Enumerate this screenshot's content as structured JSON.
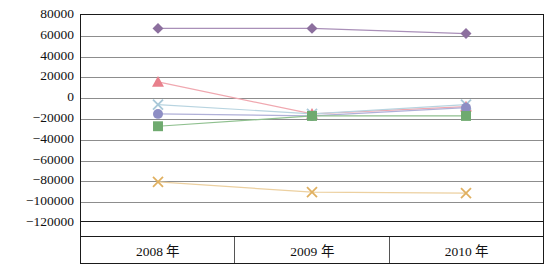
{
  "chart_data": {
    "type": "line",
    "title": "",
    "subtitle": "",
    "xlabel": "",
    "ylabel": "",
    "categories": [
      "2008 年",
      "2009 年",
      "2010 年"
    ],
    "ylim": [
      -120000,
      80000
    ],
    "ytick_step": 20000,
    "yticks": [
      80000,
      60000,
      40000,
      20000,
      0,
      -20000,
      -40000,
      -60000,
      -80000,
      -100000,
      -120000
    ],
    "ytick_labels": [
      "80000",
      "60000",
      "40000",
      "20000",
      "0",
      "−20000",
      "−40000",
      "−60000",
      "−80000",
      "−100000",
      "−120000"
    ],
    "grid": true,
    "legend": "none",
    "series": [
      {
        "name": "series-1",
        "marker": "diamond",
        "color": "#8c6f9e",
        "line_color": "#a98fb8",
        "values": [
          67000,
          67000,
          62000
        ]
      },
      {
        "name": "series-2",
        "marker": "triangle",
        "color": "#e8808c",
        "line_color": "#f0a8b0",
        "values": [
          15000,
          -16000,
          -9000
        ]
      },
      {
        "name": "series-3",
        "marker": "cross",
        "color": "#a8c8d8",
        "line_color": "#b8d4e0",
        "values": [
          -7000,
          -16000,
          -7000
        ]
      },
      {
        "name": "series-4",
        "marker": "circle",
        "color": "#8e8ec4",
        "line_color": "#b0b0d8",
        "values": [
          -16000,
          -18000,
          -10000
        ]
      },
      {
        "name": "series-5",
        "marker": "square",
        "color": "#6faa6f",
        "line_color": "#8fc08f",
        "values": [
          -28000,
          -18000,
          -18000
        ]
      },
      {
        "name": "series-6",
        "marker": "x",
        "color": "#e0b060",
        "line_color": "#ecd0a0",
        "values": [
          -82000,
          -92000,
          -93000
        ]
      }
    ]
  },
  "axes": {
    "frame_color": "#1a1a1a",
    "gridline_color": "#8d8d8d"
  }
}
